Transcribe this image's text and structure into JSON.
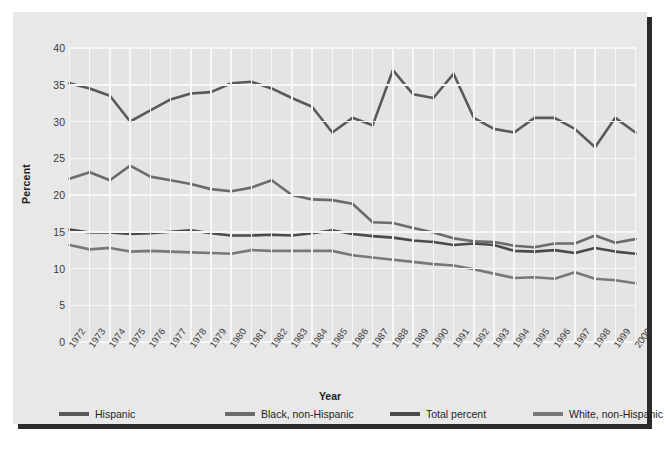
{
  "chart_data": {
    "type": "line",
    "title": "",
    "xlabel": "Year",
    "ylabel": "Percent",
    "ylim": [
      0,
      40
    ],
    "ytick_step": 5,
    "yticks": [
      "40",
      "35",
      "30",
      "25",
      "20",
      "15",
      "10",
      "5",
      "0"
    ],
    "grid": true,
    "legend_position": "bottom",
    "categories": [
      "1972",
      "1973",
      "1974",
      "1975",
      "1976",
      "1977",
      "1978",
      "1979",
      "1980",
      "1981",
      "1982",
      "1983",
      "1984",
      "1985",
      "1986",
      "1987",
      "1988",
      "1989",
      "1990",
      "1991",
      "1992",
      "1993",
      "1994",
      "1995",
      "1996",
      "1997",
      "1998",
      "1999",
      "2000"
    ],
    "series": [
      {
        "name": "Hispanic",
        "color": "#595959",
        "values": [
          35.2,
          34.5,
          33.5,
          30.0,
          31.5,
          33.0,
          33.8,
          34.0,
          35.2,
          35.4,
          34.5,
          33.2,
          32.0,
          28.5,
          30.5,
          29.5,
          37.0,
          33.7,
          33.2,
          36.5,
          30.5,
          29.0,
          28.5,
          30.5,
          30.5,
          29.0,
          26.5,
          30.5,
          28.5
        ]
      },
      {
        "name": "Black, non-Hispanic",
        "color": "#6b6b6b",
        "values": [
          22.2,
          23.1,
          22.0,
          24.0,
          22.5,
          22.0,
          21.5,
          20.8,
          20.5,
          21.0,
          22.0,
          20.0,
          19.4,
          19.3,
          18.8,
          16.3,
          16.2,
          15.5,
          14.9,
          14.1,
          13.7,
          13.6,
          13.1,
          12.9,
          13.4,
          13.4,
          14.5,
          13.5,
          14.0
        ]
      },
      {
        "name": "Total percent",
        "color": "#4a4a4a",
        "values": [
          15.3,
          14.9,
          14.9,
          14.7,
          14.8,
          15.0,
          15.2,
          14.8,
          14.5,
          14.5,
          14.6,
          14.5,
          14.8,
          15.2,
          14.7,
          14.4,
          14.2,
          13.8,
          13.6,
          13.2,
          13.4,
          13.2,
          12.4,
          12.3,
          12.5,
          12.1,
          12.8,
          12.3,
          12.0
        ]
      },
      {
        "name": "White, non-Hispanic",
        "color": "#787878",
        "values": [
          13.2,
          12.6,
          12.8,
          12.3,
          12.4,
          12.3,
          12.2,
          12.1,
          12.0,
          12.5,
          12.4,
          12.4,
          12.4,
          12.4,
          11.8,
          11.5,
          11.2,
          10.9,
          10.6,
          10.4,
          9.9,
          9.3,
          8.7,
          8.8,
          8.6,
          9.5,
          8.6,
          8.4,
          8.0
        ]
      }
    ]
  },
  "legend": {
    "items": [
      {
        "label": "Hispanic",
        "color": "#595959"
      },
      {
        "label": "Black, non-Hispanic",
        "color": "#6b6b6b"
      },
      {
        "label": "Total percent",
        "color": "#4a4a4a"
      },
      {
        "label": "White, non-Hispanic",
        "color": "#787878"
      }
    ]
  }
}
